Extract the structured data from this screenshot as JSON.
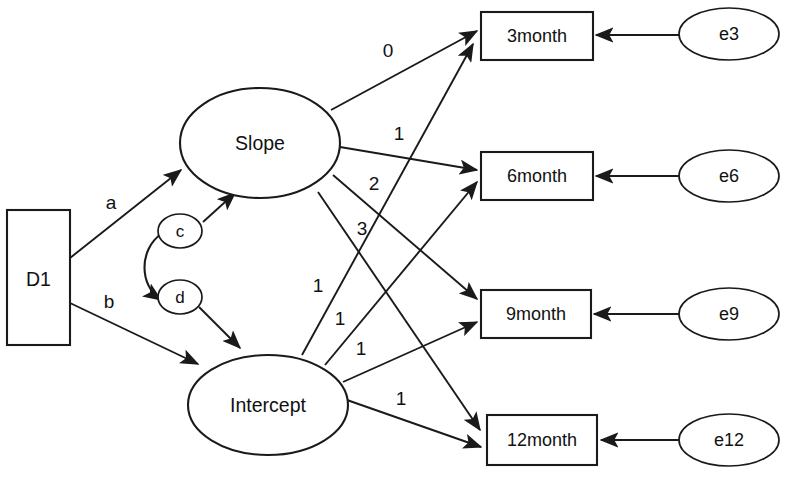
{
  "diagram": {
    "type": "sem-path-diagram",
    "background_color": "#ffffff",
    "stroke_color": "#1a1a1a"
  },
  "nodes": {
    "disturbance": {
      "label": "D1",
      "shape": "rectangle"
    },
    "latent_slope": {
      "label": "Slope",
      "shape": "ellipse"
    },
    "latent_intercept": {
      "label": "Intercept",
      "shape": "ellipse"
    },
    "mediator_c": {
      "label": "c",
      "shape": "ellipse"
    },
    "mediator_d": {
      "label": "d",
      "shape": "ellipse"
    },
    "indicators": [
      {
        "label": "3month",
        "shape": "rectangle"
      },
      {
        "label": "6month",
        "shape": "rectangle"
      },
      {
        "label": "9month",
        "shape": "rectangle"
      },
      {
        "label": "12month",
        "shape": "rectangle"
      }
    ],
    "errors": [
      {
        "label": "e3",
        "shape": "ellipse"
      },
      {
        "label": "e6",
        "shape": "ellipse"
      },
      {
        "label": "e9",
        "shape": "ellipse"
      },
      {
        "label": "e12",
        "shape": "ellipse"
      }
    ]
  },
  "edge_labels": {
    "d1_to_slope": "a",
    "d1_to_intercept": "b",
    "slope_to_3month": "0",
    "slope_to_6month": "1",
    "slope_to_9month": "2",
    "slope_to_12month": "3",
    "intercept_to_3month": "1",
    "intercept_to_6month": "1",
    "intercept_to_9month": "1",
    "intercept_to_12month": "1"
  }
}
